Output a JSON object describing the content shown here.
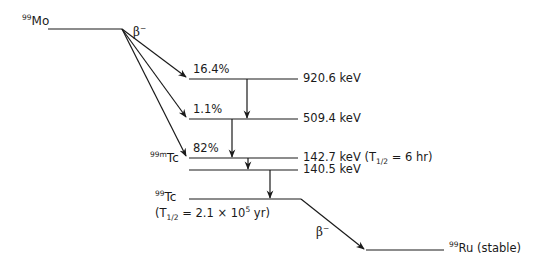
{
  "diagram": {
    "type": "nuclear-decay-scheme",
    "line_color": "#1a1a1a",
    "parent": {
      "mass_number": "99",
      "symbol": "Mo"
    },
    "parent_decay_label": {
      "symbol": "β",
      "charge": "−"
    },
    "branches": [
      {
        "percent": "16.4%",
        "to_level": "920.6 keV"
      },
      {
        "percent": "1.1%",
        "to_level": "509.4 keV"
      },
      {
        "percent": "82%",
        "to_level": "142.7 keV"
      }
    ],
    "levels": [
      {
        "energy": "920.6 keV"
      },
      {
        "energy": "509.4 keV"
      },
      {
        "energy": "142.7 keV",
        "halflife_prefix": "(T",
        "halflife_sub": "1/2",
        "halflife_suffix": " = 6 hr)"
      },
      {
        "energy": "140.5 keV"
      }
    ],
    "metastable": {
      "mass_number": "99m",
      "symbol": "Tc"
    },
    "ground": {
      "mass_number": "99",
      "symbol": "Tc",
      "halflife_prefix": "(T",
      "halflife_sub": "1/2",
      "halflife_mid": " = 2.1 × 10",
      "halflife_exp": "5",
      "halflife_suffix": " yr)"
    },
    "ground_decay_label": {
      "symbol": "β",
      "charge": "−"
    },
    "daughter": {
      "mass_number": "99",
      "symbol": "Ru",
      "note": " (stable)"
    }
  }
}
